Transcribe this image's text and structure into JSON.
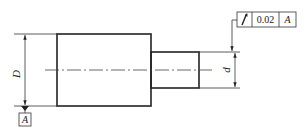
{
  "drawing": {
    "type": "shaft-with-runout-tolerance",
    "dimensions": {
      "large_diameter_label": "D",
      "small_diameter_label": "d"
    },
    "datum": {
      "label": "A"
    },
    "feature_control_frame": {
      "symbol": "circular-runout",
      "symbol_glyph": "↗",
      "tolerance": "0.02",
      "datum_ref": "A"
    }
  }
}
